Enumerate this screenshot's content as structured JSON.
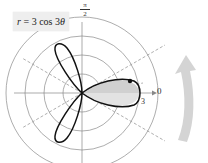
{
  "equation": {
    "lhs": "r",
    "eq": " = 3 cos 3",
    "theta": "θ",
    "full": "r = 3 cos 3θ"
  },
  "axes": {
    "top_label_num": "π",
    "top_label_den": "2",
    "right_label": "0",
    "radius_label": "3"
  },
  "polar_grid": {
    "rings": [
      1,
      2,
      3,
      4
    ],
    "max_r": 3
  },
  "curve": {
    "type": "rose",
    "amplitude": 3,
    "k": 3,
    "petals": 3,
    "shaded_region": "theta from -π/6 to π/6 (right petal, partially)",
    "stroke_color": "#111111",
    "shade_color": "#d0d0d0"
  },
  "colors": {
    "grid": "#888888",
    "dashed": "#999999",
    "arrow": "#d4d4d4"
  }
}
